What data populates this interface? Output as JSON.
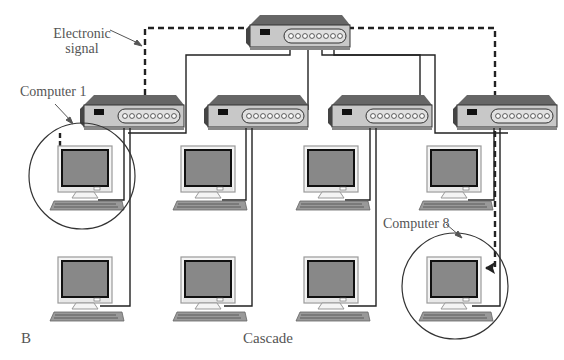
{
  "figure": {
    "panel_letter": "B",
    "caption": "Cascade",
    "labels": {
      "signal_line1": "Electronic",
      "signal_line2": "signal",
      "computer_first": "Computer 1",
      "computer_last": "Computer 8"
    },
    "hubs": [
      {
        "id": "root-hub",
        "level": 0
      },
      {
        "id": "hub-1",
        "level": 1
      },
      {
        "id": "hub-2",
        "level": 1
      },
      {
        "id": "hub-3",
        "level": 1
      },
      {
        "id": "hub-4",
        "level": 1
      }
    ],
    "computers": [
      {
        "id": "computer-1",
        "hub": "hub-1",
        "row": 1,
        "highlighted": true
      },
      {
        "id": "computer-2",
        "hub": "hub-1",
        "row": 2
      },
      {
        "id": "computer-3",
        "hub": "hub-2",
        "row": 1
      },
      {
        "id": "computer-4",
        "hub": "hub-2",
        "row": 2
      },
      {
        "id": "computer-5",
        "hub": "hub-3",
        "row": 1
      },
      {
        "id": "computer-6",
        "hub": "hub-3",
        "row": 2
      },
      {
        "id": "computer-7",
        "hub": "hub-4",
        "row": 1
      },
      {
        "id": "computer-8",
        "hub": "hub-4",
        "row": 2,
        "highlighted": true
      }
    ],
    "colors": {
      "line": "#222222",
      "screen": "#8a8a8a",
      "hub_top": "#555555",
      "hub_front": "#bbbbbb",
      "label": "#555555"
    }
  }
}
